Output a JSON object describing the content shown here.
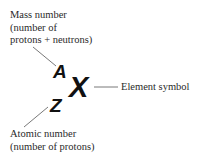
{
  "diagram": {
    "mass_label": {
      "lines": [
        "Mass number",
        "(number of",
        "protons + neutrons)"
      ]
    },
    "atomic_label": {
      "lines": [
        "Atomic number",
        "(number of protons)"
      ]
    },
    "element_label": "Element symbol",
    "symbols": {
      "mass": "A",
      "atomic": "Z",
      "element": "X"
    },
    "colors": {
      "text": "#2a2a2a",
      "symbol": "#111111",
      "leader_line": "#555555"
    }
  }
}
